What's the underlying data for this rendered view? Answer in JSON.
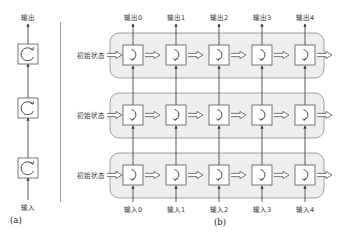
{
  "figure": {
    "panel_a": {
      "caption": "(a)",
      "top_label": "输出",
      "bottom_label": "输入",
      "cells": 3,
      "cell_icon": "recurrent-loop-icon"
    },
    "panel_b": {
      "caption": "(b)",
      "layers": [
        {
          "init_label": "初始状态"
        },
        {
          "init_label": "初始状态"
        },
        {
          "init_label": "初始状态"
        }
      ],
      "outputs": [
        "输出0",
        "输出1",
        "输出2",
        "输出3",
        "输出4"
      ],
      "inputs": [
        "输入0",
        "输入1",
        "输入2",
        "输入3",
        "输入4"
      ],
      "cell_icon": "unrolled-step-icon"
    },
    "colors": {
      "layer_fill": "#eeeeee",
      "layer_stroke": "#888888",
      "cell_fill": "#ffffff",
      "cell_stroke": "#555555",
      "arrow": "#333333",
      "divider": "#888888"
    }
  }
}
